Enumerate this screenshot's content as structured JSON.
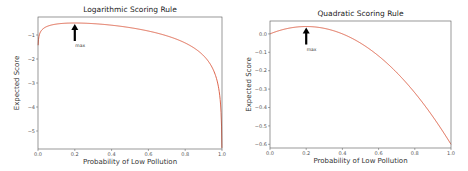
{
  "chart_data": [
    {
      "type": "line",
      "title": "Logarithmic Scoring Rule",
      "xlabel": "Probability of Low Pollution",
      "ylabel": "Expected Score",
      "xlim": [
        0.0,
        1.0
      ],
      "ylim": [
        -5.75,
        -0.25
      ],
      "xticks": [
        "0.0",
        "0.2",
        "0.4",
        "0.6",
        "0.8",
        "1.0"
      ],
      "yticks": [
        "-1",
        "-2",
        "-3",
        "-4",
        "-5"
      ],
      "grid": false,
      "series": [
        {
          "name": "expected log score",
          "color": "#d9553a",
          "x": [
            0.001,
            0.01,
            0.05,
            0.1,
            0.2,
            0.3,
            0.4,
            0.5,
            0.6,
            0.7,
            0.8,
            0.9,
            0.95,
            0.99,
            0.999
          ],
          "y": [
            -1.38,
            -0.93,
            -0.64,
            -0.54,
            -0.5,
            -0.53,
            -0.59,
            -0.69,
            -0.83,
            -1.03,
            -1.33,
            -1.86,
            -2.41,
            -3.69,
            -5.53
          ]
        }
      ],
      "annotations": [
        {
          "text": "max",
          "x": 0.2,
          "arrow": true
        }
      ]
    },
    {
      "type": "line",
      "title": "Quadratic Scoring Rule",
      "xlabel": "Probability of Low Pollution",
      "ylabel": "Expected Score",
      "xlim": [
        0.0,
        1.0
      ],
      "ylim": [
        -0.62,
        0.07
      ],
      "xticks": [
        "0.0",
        "0.2",
        "0.4",
        "0.6",
        "0.8",
        "1.0"
      ],
      "yticks": [
        "0.0",
        "-0.1",
        "-0.2",
        "-0.3",
        "-0.4",
        "-0.5",
        "-0.6"
      ],
      "grid": false,
      "series": [
        {
          "name": "expected quadratic score",
          "color": "#d9553a",
          "x": [
            0.0,
            0.1,
            0.2,
            0.3,
            0.4,
            0.5,
            0.6,
            0.7,
            0.8,
            0.9,
            1.0
          ],
          "y": [
            0.0,
            0.03,
            0.04,
            0.03,
            0.0,
            -0.05,
            -0.12,
            -0.21,
            -0.32,
            -0.45,
            -0.6
          ]
        }
      ],
      "annotations": [
        {
          "text": "max",
          "x": 0.2,
          "arrow": true
        }
      ]
    }
  ]
}
